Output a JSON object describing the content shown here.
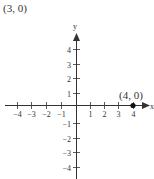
{
  "caption": "(3, 0)",
  "graph": {
    "x_axis_label": "x",
    "y_axis_label": "y",
    "x_ticks": [
      {
        "label": "−4",
        "x": 17
      },
      {
        "label": "−3",
        "x": 31
      },
      {
        "label": "−2",
        "x": 46
      },
      {
        "label": "−1",
        "x": 61
      },
      {
        "label": "1",
        "x": 90
      },
      {
        "label": "2",
        "x": 104
      },
      {
        "label": "3",
        "x": 118
      },
      {
        "label": "4",
        "x": 133
      }
    ],
    "y_ticks": [
      {
        "label": "4",
        "y": 49
      },
      {
        "label": "3",
        "y": 64
      },
      {
        "label": "2",
        "y": 78
      },
      {
        "label": "1",
        "y": 93
      },
      {
        "label": "−1",
        "y": 123
      },
      {
        "label": "−2",
        "y": 138
      },
      {
        "label": "−3",
        "y": 152
      },
      {
        "label": "−4",
        "y": 167
      }
    ],
    "point": {
      "label": "(4, 0)",
      "x": 4,
      "y": 0
    },
    "colors": {
      "axis": "#333333",
      "point": "#111111"
    }
  },
  "chart_data": {
    "type": "scatter",
    "title": "(3, 0)",
    "xlabel": "x",
    "ylabel": "y",
    "xlim": [
      -4,
      4
    ],
    "ylim": [
      -4,
      4
    ],
    "grid": false,
    "x_tick_labels": [
      "-4",
      "-3",
      "-2",
      "-1",
      "1",
      "2",
      "3",
      "4"
    ],
    "y_tick_labels": [
      "-4",
      "-3",
      "-2",
      "-1",
      "1",
      "2",
      "3",
      "4"
    ],
    "series": [
      {
        "name": "point",
        "points": [
          {
            "x": 4,
            "y": 0,
            "label": "(4, 0)"
          }
        ]
      }
    ]
  }
}
